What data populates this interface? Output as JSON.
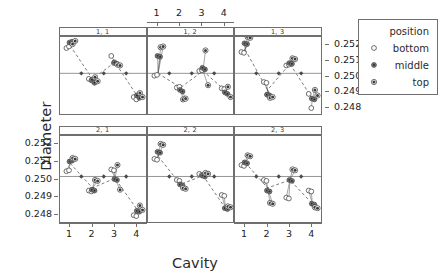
{
  "chart_data": {
    "type": "scatter",
    "title": "",
    "xlabel": "Cavity",
    "ylabel": "Diameter",
    "legend": {
      "title": "position",
      "position": "right",
      "entries": [
        {
          "label": "bottom",
          "symbol": "open-circle"
        },
        {
          "label": "middle",
          "symbol": "filled-circle"
        },
        {
          "label": "top",
          "symbol": "dotted-circle"
        }
      ]
    },
    "layout": {
      "rows": 2,
      "cols": 3,
      "strip_labels": [
        [
          "1, 1",
          "1, 2",
          "1, 3"
        ],
        [
          "2, 1",
          "2, 2",
          "2, 3"
        ]
      ],
      "x_axis_top_panel": "1, 2",
      "y_axis_side_top_row": "right",
      "y_axis_side_bottom_row": "left",
      "grid": false
    },
    "x": [
      1,
      2,
      3,
      4
    ],
    "xticklabels": [
      "1",
      "2",
      "3",
      "4"
    ],
    "xlim": [
      0.55,
      4.45
    ],
    "yticklabels": [
      "0.248",
      "0.249",
      "0.250",
      "0.251",
      "0.252"
    ],
    "ytickvalues": [
      0.248,
      0.249,
      0.25,
      0.251,
      0.252
    ],
    "ylim": [
      0.2475,
      0.2525
    ],
    "reference_line_y": 0.2502,
    "panels": [
      {
        "name": "1, 1",
        "row": 1,
        "col": 1,
        "means": [
          0.25195,
          0.24985,
          0.2509,
          0.24875
        ],
        "points": [
          {
            "cavity": 1,
            "series": [
              {
                "position": "bottom",
                "values": [
                  0.2518,
                  0.2519
                ]
              },
              {
                "position": "middle",
                "values": [
                  0.25215,
                  0.2522
                ]
              },
              {
                "position": "top",
                "values": [
                  0.25205,
                  0.25225
                ]
              }
            ]
          },
          {
            "cavity": 2,
            "series": [
              {
                "position": "bottom",
                "values": [
                  0.24985,
                  0.24975
                ]
              },
              {
                "position": "middle",
                "values": [
                  0.2498,
                  0.2496
                ]
              },
              {
                "position": "top",
                "values": [
                  0.24995,
                  0.2497
                ]
              }
            ]
          },
          {
            "cavity": 3,
            "series": [
              {
                "position": "bottom",
                "values": [
                  0.2513,
                  0.25085
                ]
              },
              {
                "position": "middle",
                "values": [
                  0.2509,
                  0.2508
                ]
              },
              {
                "position": "top",
                "values": [
                  0.25075,
                  0.2507
                ]
              }
            ]
          },
          {
            "cavity": 4,
            "series": [
              {
                "position": "bottom",
                "values": [
                  0.2487,
                  0.24855
                ]
              },
              {
                "position": "middle",
                "values": [
                  0.2488,
                  0.24865
                ]
              },
              {
                "position": "top",
                "values": [
                  0.24895,
                  0.2487
                ]
              }
            ]
          }
        ]
      },
      {
        "name": "1, 2",
        "row": 1,
        "col": 2,
        "means": [
          0.2502,
          0.2493,
          0.25035,
          0.2491
        ],
        "points": [
          {
            "cavity": 1,
            "series": [
              {
                "position": "bottom",
                "values": [
                  0.25005,
                  0.2501
                ]
              },
              {
                "position": "middle",
                "values": [
                  0.2513,
                  0.25125
                ]
              },
              {
                "position": "top",
                "values": [
                  0.25185,
                  0.2519
                ]
              }
            ]
          },
          {
            "cavity": 2,
            "series": [
              {
                "position": "bottom",
                "values": [
                  0.2493,
                  0.24935
                ]
              },
              {
                "position": "middle",
                "values": [
                  0.24915,
                  0.24905
                ]
              },
              {
                "position": "top",
                "values": [
                  0.24855,
                  0.2486
                ]
              }
            ]
          },
          {
            "cavity": 3,
            "series": [
              {
                "position": "bottom",
                "values": [
                  0.25035,
                  0.2504
                ]
              },
              {
                "position": "middle",
                "values": [
                  0.25055,
                  0.25045
                ]
              },
              {
                "position": "top",
                "values": [
                  0.25165,
                  0.24945
                ]
              }
            ]
          },
          {
            "cavity": 4,
            "series": [
              {
                "position": "bottom",
                "values": [
                  0.24925,
                  0.2492
                ]
              },
              {
                "position": "middle",
                "values": [
                  0.249,
                  0.2489
                ]
              },
              {
                "position": "top",
                "values": [
                  0.24935,
                  0.2487
                ]
              }
            ]
          }
        ]
      },
      {
        "name": "1, 3",
        "row": 1,
        "col": 3,
        "means": [
          0.2517,
          0.24915,
          0.2508,
          0.2486
        ],
        "points": [
          {
            "cavity": 1,
            "series": [
              {
                "position": "bottom",
                "values": [
                  0.25155,
                  0.2515
                ]
              },
              {
                "position": "middle",
                "values": [
                  0.2521,
                  0.25205
                ]
              },
              {
                "position": "top",
                "values": [
                  0.2525,
                  0.25245
                ]
              }
            ]
          },
          {
            "cavity": 2,
            "series": [
              {
                "position": "bottom",
                "values": [
                  0.24965,
                  0.2496
                ]
              },
              {
                "position": "middle",
                "values": [
                  0.24885,
                  0.2488
                ]
              },
              {
                "position": "top",
                "values": [
                  0.24865,
                  0.2487
                ]
              }
            ]
          },
          {
            "cavity": 3,
            "series": [
              {
                "position": "bottom",
                "values": [
                  0.2507,
                  0.25075
                ]
              },
              {
                "position": "middle",
                "values": [
                  0.25085,
                  0.2508
                ]
              },
              {
                "position": "top",
                "values": [
                  0.25115,
                  0.2511
                ]
              }
            ]
          },
          {
            "cavity": 4,
            "series": [
              {
                "position": "bottom",
                "values": [
                  0.2489,
                  0.248
                ]
              },
              {
                "position": "middle",
                "values": [
                  0.2486,
                  0.24855
                ]
              },
              {
                "position": "top",
                "values": [
                  0.24915,
                  0.2488
                ]
              }
            ]
          }
        ]
      },
      {
        "name": "2, 1",
        "row": 2,
        "col": 1,
        "means": [
          0.25095,
          0.24955,
          0.2501,
          0.2483
        ],
        "points": [
          {
            "cavity": 1,
            "series": [
              {
                "position": "bottom",
                "values": [
                  0.2505,
                  0.25055
                ]
              },
              {
                "position": "middle",
                "values": [
                  0.25105,
                  0.2511
                ]
              },
              {
                "position": "top",
                "values": [
                  0.25125,
                  0.2512
                ]
              }
            ]
          },
          {
            "cavity": 2,
            "series": [
              {
                "position": "bottom",
                "values": [
                  0.2494,
                  0.24935
                ]
              },
              {
                "position": "middle",
                "values": [
                  0.24945,
                  0.2494
                ]
              },
              {
                "position": "top",
                "values": [
                  0.25,
                  0.24995
                ]
              }
            ]
          },
          {
            "cavity": 3,
            "series": [
              {
                "position": "bottom",
                "values": [
                  0.2506,
                  0.25055
                ]
              },
              {
                "position": "middle",
                "values": [
                  0.25005,
                  0.25
                ]
              },
              {
                "position": "top",
                "values": [
                  0.25085,
                  0.24945
                ]
              }
            ]
          },
          {
            "cavity": 4,
            "series": [
              {
                "position": "bottom",
                "values": [
                  0.248,
                  0.24795
                ]
              },
              {
                "position": "middle",
                "values": [
                  0.24825,
                  0.2482
                ]
              },
              {
                "position": "top",
                "values": [
                  0.24855,
                  0.2483
                ]
              }
            ]
          }
        ]
      },
      {
        "name": "2, 2",
        "row": 2,
        "col": 2,
        "means": [
          0.25135,
          0.24975,
          0.25025,
          0.2484
        ],
        "points": [
          {
            "cavity": 1,
            "series": [
              {
                "position": "bottom",
                "values": [
                  0.2512,
                  0.25115
                ]
              },
              {
                "position": "middle",
                "values": [
                  0.2516,
                  0.25155
                ]
              },
              {
                "position": "top",
                "values": [
                  0.25205,
                  0.252
                ]
              }
            ]
          },
          {
            "cavity": 2,
            "series": [
              {
                "position": "bottom",
                "values": [
                  0.25,
                  0.24995
                ]
              },
              {
                "position": "middle",
                "values": [
                  0.24975,
                  0.2497
                ]
              },
              {
                "position": "top",
                "values": [
                  0.24955,
                  0.2495
                ]
              }
            ]
          },
          {
            "cavity": 3,
            "series": [
              {
                "position": "bottom",
                "values": [
                  0.25035,
                  0.2503
                ]
              },
              {
                "position": "middle",
                "values": [
                  0.25025,
                  0.2502
                ]
              },
              {
                "position": "top",
                "values": [
                  0.2504,
                  0.25035
                ]
              }
            ]
          },
          {
            "cavity": 4,
            "series": [
              {
                "position": "bottom",
                "values": [
                  0.24915,
                  0.2491
                ]
              },
              {
                "position": "middle",
                "values": [
                  0.2484,
                  0.24835
                ]
              },
              {
                "position": "top",
                "values": [
                  0.2485,
                  0.24845
                ]
              }
            ]
          }
        ]
      },
      {
        "name": "2, 3",
        "row": 2,
        "col": 3,
        "means": [
          0.251,
          0.24955,
          0.25,
          0.24865
        ],
        "points": [
          {
            "cavity": 1,
            "series": [
              {
                "position": "bottom",
                "values": [
                  0.25085,
                  0.2508
                ]
              },
              {
                "position": "middle",
                "values": [
                  0.251,
                  0.25095
                ]
              },
              {
                "position": "top",
                "values": [
                  0.2514,
                  0.25135
                ]
              }
            ]
          },
          {
            "cavity": 2,
            "series": [
              {
                "position": "bottom",
                "values": [
                  0.25,
                  0.24995
                ]
              },
              {
                "position": "middle",
                "values": [
                  0.2494,
                  0.24935
                ]
              },
              {
                "position": "top",
                "values": [
                  0.2487,
                  0.24865
                ]
              }
            ]
          },
          {
            "cavity": 3,
            "series": [
              {
                "position": "bottom",
                "values": [
                  0.249,
                  0.24895
                ]
              },
              {
                "position": "middle",
                "values": [
                  0.25,
                  0.24995
                ]
              },
              {
                "position": "top",
                "values": [
                  0.2506,
                  0.25055
                ]
              }
            ]
          },
          {
            "cavity": 4,
            "series": [
              {
                "position": "bottom",
                "values": [
                  0.2494,
                  0.24935
                ]
              },
              {
                "position": "middle",
                "values": [
                  0.24865,
                  0.2486
                ]
              },
              {
                "position": "top",
                "values": [
                  0.24845,
                  0.2484
                ]
              }
            ]
          }
        ]
      }
    ]
  },
  "colors": {
    "axis": "#6f6f6f",
    "point": "#4a4a4a",
    "line_dashed": "#5a5a5a",
    "line_solid": "#8a8a8a",
    "text": "#2b2b2b"
  }
}
